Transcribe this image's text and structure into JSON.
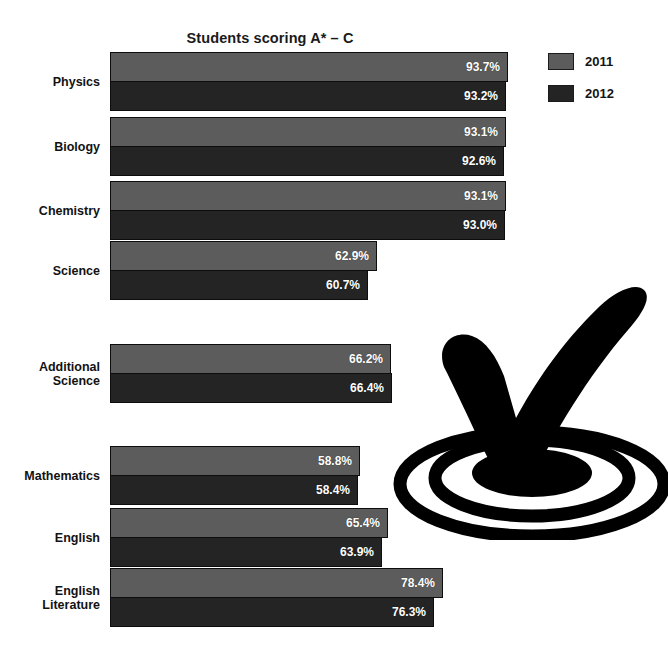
{
  "chart_data": {
    "type": "bar",
    "orientation": "horizontal",
    "title": "Students scoring A* – C",
    "xlabel": "",
    "ylabel": "",
    "xlim": [
      0,
      100
    ],
    "grid": false,
    "legend_position": "top-right",
    "categories": [
      "Physics",
      "Biology",
      "Chemistry",
      "Science",
      "Additional Science",
      "Mathematics",
      "English",
      "English Literature"
    ],
    "series": [
      {
        "name": "2011",
        "color": "#5c5c5c",
        "values": [
          93.7,
          93.1,
          93.1,
          62.9,
          66.2,
          58.8,
          65.4,
          78.4
        ],
        "value_labels": [
          "93.7%",
          "93.1%",
          "93.1%",
          "62.9%",
          "66.2%",
          "58.8%",
          "65.4%",
          "78.4%"
        ]
      },
      {
        "name": "2012",
        "color": "#242424",
        "values": [
          93.2,
          92.6,
          93.0,
          60.7,
          66.4,
          58.4,
          63.9,
          76.3
        ],
        "value_labels": [
          "93.2%",
          "92.6%",
          "93.0%",
          "60.7%",
          "66.4%",
          "58.4%",
          "63.9%",
          "76.3%"
        ]
      }
    ]
  },
  "legend": {
    "items": [
      {
        "label": "2011",
        "color": "#5c5c5c"
      },
      {
        "label": "2012",
        "color": "#242424"
      }
    ]
  },
  "groups": [
    {
      "label": "Physics",
      "label_lines": [
        "Physics"
      ],
      "top": 52,
      "bars": [
        {
          "series": "2011",
          "value": 93.7,
          "value_label": "93.7%"
        },
        {
          "series": "2012",
          "value": 93.2,
          "value_label": "93.2%"
        }
      ]
    },
    {
      "label": "Biology",
      "label_lines": [
        "Biology"
      ],
      "top": 117,
      "bars": [
        {
          "series": "2011",
          "value": 93.1,
          "value_label": "93.1%"
        },
        {
          "series": "2012",
          "value": 92.6,
          "value_label": "92.6%"
        }
      ]
    },
    {
      "label": "Chemistry",
      "label_lines": [
        "Chemistry"
      ],
      "top": 181,
      "bars": [
        {
          "series": "2011",
          "value": 93.1,
          "value_label": "93.1%"
        },
        {
          "series": "2012",
          "value": 93.0,
          "value_label": "93.0%"
        }
      ]
    },
    {
      "label": "Science",
      "label_lines": [
        "Science"
      ],
      "top": 241,
      "bars": [
        {
          "series": "2011",
          "value": 62.9,
          "value_label": "62.9%"
        },
        {
          "series": "2012",
          "value": 60.7,
          "value_label": "60.7%"
        }
      ]
    },
    {
      "label": "Additional Science",
      "label_lines": [
        "Additional",
        "Science"
      ],
      "top": 344,
      "bars": [
        {
          "series": "2011",
          "value": 66.2,
          "value_label": "66.2%"
        },
        {
          "series": "2012",
          "value": 66.4,
          "value_label": "66.4%"
        }
      ]
    },
    {
      "label": "Mathematics",
      "label_lines": [
        "Mathematics"
      ],
      "top": 446,
      "bars": [
        {
          "series": "2011",
          "value": 58.8,
          "value_label": "58.8%"
        },
        {
          "series": "2012",
          "value": 58.4,
          "value_label": "58.4%"
        }
      ]
    },
    {
      "label": "English",
      "label_lines": [
        "English"
      ],
      "top": 508,
      "bars": [
        {
          "series": "2011",
          "value": 65.4,
          "value_label": "65.4%"
        },
        {
          "series": "2012",
          "value": 63.9,
          "value_label": "63.9%"
        }
      ]
    },
    {
      "label": "English Literature",
      "label_lines": [
        "English",
        "Literature"
      ],
      "top": 568,
      "bars": [
        {
          "series": "2011",
          "value": 78.4,
          "value_label": "78.4%"
        },
        {
          "series": "2012",
          "value": 76.3,
          "value_label": "76.3%"
        }
      ]
    }
  ],
  "decoration": {
    "name": "checkmark-on-target",
    "color": "#000000"
  },
  "layout": {
    "bar_origin_x": 110,
    "px_per_percent": 4.25,
    "bar_height": 30
  }
}
